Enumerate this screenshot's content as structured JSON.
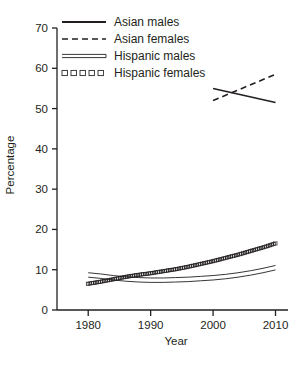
{
  "chart_data": {
    "type": "line",
    "title": "",
    "xlabel": "Year",
    "ylabel": "Percentage",
    "xlim": [
      1975,
      2012
    ],
    "ylim": [
      0,
      70
    ],
    "xticks": [
      1980,
      1990,
      2000,
      2010
    ],
    "yticks": [
      0,
      10,
      20,
      30,
      40,
      50,
      60,
      70
    ],
    "xtick_labels": [
      "1980",
      "1990",
      "2000",
      "2010"
    ],
    "ytick_labels": [
      "0",
      "10",
      "20",
      "30",
      "40",
      "50",
      "60",
      "70"
    ],
    "grid": false,
    "legend_position": "top-left-inside",
    "series": [
      {
        "name": "Asian males",
        "style": "solid",
        "x": [
          2000,
          2010
        ],
        "values": [
          55.0,
          51.5
        ]
      },
      {
        "name": "Asian females",
        "style": "dashed",
        "x": [
          2000,
          2010
        ],
        "values": [
          52.0,
          58.5
        ]
      },
      {
        "name": "Hispanic males",
        "style": "double",
        "x": [
          1980,
          1982,
          1984,
          1986,
          1988,
          1990,
          1992,
          1994,
          1996,
          1998,
          2000,
          2002,
          2004,
          2006,
          2008,
          2010
        ],
        "values": [
          8.7,
          8.4,
          8.0,
          7.7,
          7.5,
          7.4,
          7.4,
          7.5,
          7.6,
          7.8,
          8.0,
          8.3,
          8.7,
          9.2,
          9.8,
          10.5
        ]
      },
      {
        "name": "Hispanic females",
        "style": "open-squares",
        "x": [
          1980,
          1982,
          1984,
          1986,
          1988,
          1990,
          1992,
          1994,
          1996,
          1998,
          2000,
          2002,
          2004,
          2006,
          2008,
          2010
        ],
        "values": [
          6.5,
          7.0,
          7.6,
          8.2,
          8.7,
          9.1,
          9.6,
          10.1,
          10.7,
          11.4,
          12.1,
          12.9,
          13.7,
          14.6,
          15.5,
          16.5
        ]
      }
    ]
  },
  "legend": {
    "items": [
      {
        "label": "Asian males",
        "style": "solid"
      },
      {
        "label": "Asian females",
        "style": "dashed"
      },
      {
        "label": "Hispanic males",
        "style": "double"
      },
      {
        "label": "Hispanic females",
        "style": "open-squares"
      }
    ]
  }
}
